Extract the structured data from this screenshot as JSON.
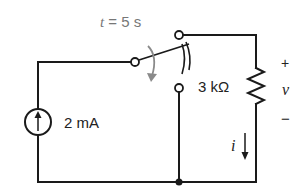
{
  "diagram": {
    "type": "circuit-schematic",
    "switch": {
      "label_var": "t",
      "label_eq": "=",
      "label_value": "5 s",
      "action": "switches from left terminal to lower terminal"
    },
    "source": {
      "kind": "current-source",
      "value": "2 mA",
      "arrow_direction": "up"
    },
    "resistor": {
      "value": "3 kΩ"
    },
    "voltage": {
      "plus": "+",
      "var": "v",
      "minus": "−"
    },
    "current": {
      "var": "i",
      "arrow_direction": "down"
    },
    "colors": {
      "wire": "#1a1a1a",
      "switch_arrow": "#8a8a8a",
      "label_gray": "#777777",
      "background": "#ffffff"
    }
  }
}
